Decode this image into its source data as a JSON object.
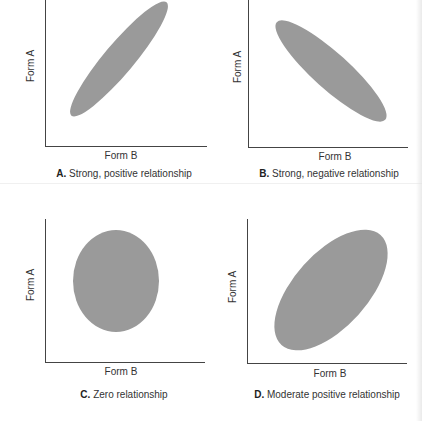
{
  "figure": {
    "colors": {
      "ellipse": "#9a9a9a",
      "axis": "#444444",
      "text": "#333333"
    },
    "panels": [
      {
        "id": "A",
        "letter": "A.",
        "caption": " Strong, positive relationship",
        "xlabel": "Form B",
        "ylabel": "Form A",
        "relationship": "strong positive"
      },
      {
        "id": "B",
        "letter": "B.",
        "caption": " Strong, negative relationship",
        "xlabel": "Form B",
        "ylabel": "Form A",
        "relationship": "strong negative"
      },
      {
        "id": "C",
        "letter": "C.",
        "caption": " Zero relationship",
        "xlabel": "Form B",
        "ylabel": "Form A",
        "relationship": "zero"
      },
      {
        "id": "D",
        "letter": "D.",
        "caption": " Moderate positive relationship",
        "xlabel": "Form B",
        "ylabel": "Form A",
        "relationship": "moderate positive"
      }
    ]
  }
}
